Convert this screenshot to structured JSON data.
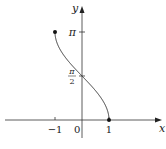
{
  "chart_data": {
    "type": "line",
    "title": "",
    "function": "y = arccos(x)",
    "xlabel": "x",
    "ylabel": "y",
    "xlim": [
      -1.5,
      1.5
    ],
    "ylim": [
      0,
      3.14159
    ],
    "x_ticks": [
      {
        "value": -1,
        "label": "−1"
      },
      {
        "value": 1,
        "label": "1"
      }
    ],
    "y_ticks": [
      {
        "value": 1.5708,
        "label_num": "π",
        "label_den": "2"
      },
      {
        "value": 3.14159,
        "label": "π"
      }
    ],
    "origin_label": "0",
    "endpoints": [
      {
        "x": -1,
        "y": 3.14159
      },
      {
        "x": 1,
        "y": 0
      }
    ],
    "series": [
      {
        "name": "arccos",
        "x_range": [
          -1,
          1
        ]
      }
    ],
    "grid": false
  }
}
